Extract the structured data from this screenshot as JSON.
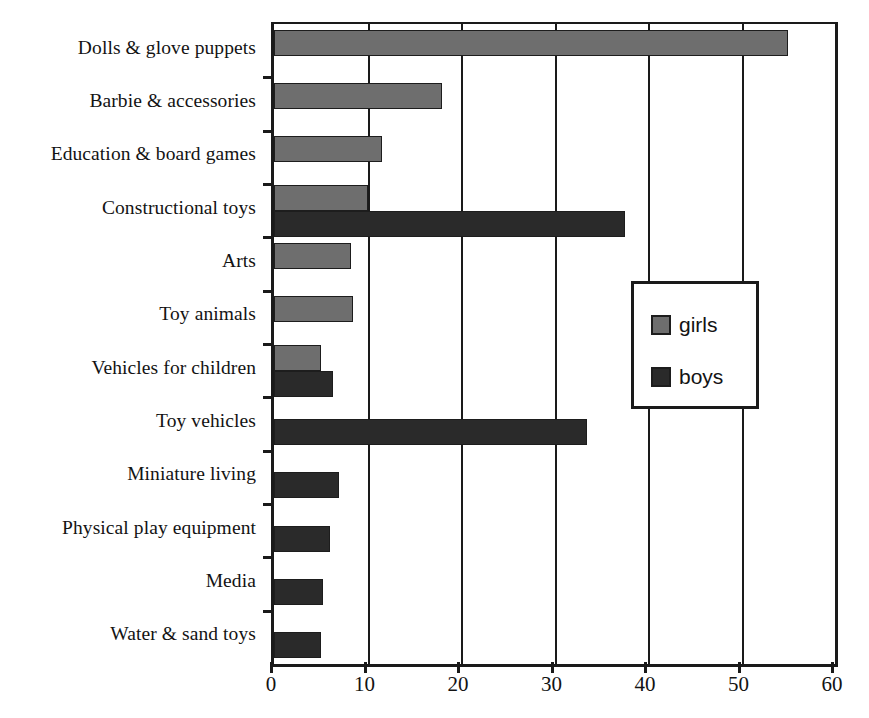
{
  "chart_data": {
    "type": "bar",
    "orientation": "horizontal",
    "title": "",
    "xlabel": "",
    "ylabel": "",
    "xlim": [
      0,
      60
    ],
    "xticks": [
      0,
      10,
      20,
      30,
      40,
      50,
      60
    ],
    "xtick_labels": [
      "0",
      "10",
      "20",
      "30",
      "40",
      "50",
      "60"
    ],
    "grid": true,
    "grid_axis": "x",
    "legend_position": "center-right",
    "categories": [
      "Dolls & glove puppets",
      "Barbie & accessories",
      "Education & board games",
      "Constructional toys",
      "Arts",
      "Toy animals",
      "Vehicles for children",
      "Toy vehicles",
      "Miniature living",
      "Physical play equipment",
      "Media",
      "Water & sand toys"
    ],
    "series": [
      {
        "name": "girls",
        "color": "#6e6e6e",
        "values": [
          55,
          18,
          11.5,
          10,
          8.2,
          8.4,
          5,
          null,
          null,
          null,
          null,
          null
        ]
      },
      {
        "name": "boys",
        "color": "#2a2a2a",
        "values": [
          null,
          null,
          null,
          37.5,
          null,
          null,
          6.3,
          33.5,
          7,
          6,
          5.2,
          5
        ]
      }
    ]
  },
  "legend": {
    "entries": [
      {
        "label": "girls",
        "swatch_color": "#6e6e6e"
      },
      {
        "label": "boys",
        "swatch_color": "#2a2a2a"
      }
    ]
  },
  "axis_colors": {
    "axis_line": "#1a1a1a",
    "gridline": "#1a1a1a",
    "text": "#131313",
    "background": "#ffffff"
  }
}
